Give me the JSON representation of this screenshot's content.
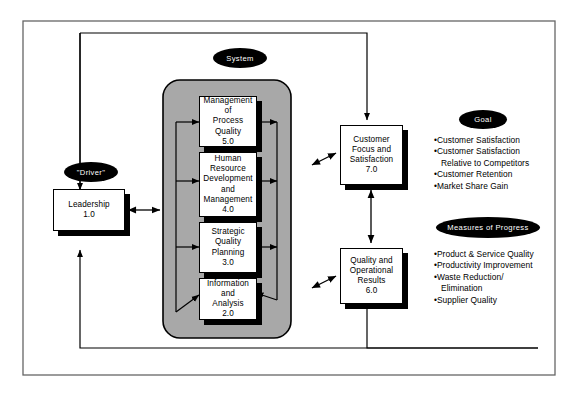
{
  "diagram": {
    "title_ovals": [
      {
        "id": "system",
        "label": "System"
      },
      {
        "id": "driver",
        "label": "\"Driver\""
      },
      {
        "id": "goal",
        "label": "Goal"
      },
      {
        "id": "measures",
        "label": "Measures of Progress"
      }
    ],
    "nodes": [
      {
        "id": "leadership",
        "label": "Leadership\n1.0"
      },
      {
        "id": "process-quality",
        "label": "Management of\nProcess Quality\n5.0"
      },
      {
        "id": "human-resource",
        "label": "Human\nResource\nDevelopment\nand\nManagement\n4.0"
      },
      {
        "id": "strategic-planning",
        "label": "Strategic\nQuality\nPlanning\n3.0"
      },
      {
        "id": "information",
        "label": "Information and\nAnalysis\n2.0"
      },
      {
        "id": "customer-focus",
        "label": "Customer\nFocus and\nSatisfaction\n7.0"
      },
      {
        "id": "quality-results",
        "label": "Quality and\nOperational\nResults\n6.0"
      }
    ],
    "goal_items": [
      {
        "text": "•Customer Satisfaction",
        "indent": false
      },
      {
        "text": "•Customer Satisfaction",
        "indent": false
      },
      {
        "text": "Relative to Competitors",
        "indent": true
      },
      {
        "text": "•Customer Retention",
        "indent": false
      },
      {
        "text": "•Market Share Gain",
        "indent": false
      }
    ],
    "measures_items": [
      {
        "text": "•Product & Service Quality",
        "indent": false
      },
      {
        "text": "•Productivity Improvement",
        "indent": false
      },
      {
        "text": "•Waste Reduction/",
        "indent": false
      },
      {
        "text": "Elimination",
        "indent": true
      },
      {
        "text": "•Supplier Quality",
        "indent": false
      }
    ],
    "colors": {
      "system_fill": "#a8a8a8",
      "line": "#000000",
      "box_fill": "#ffffff",
      "shadow": "#000000",
      "frame": "#555555"
    }
  }
}
